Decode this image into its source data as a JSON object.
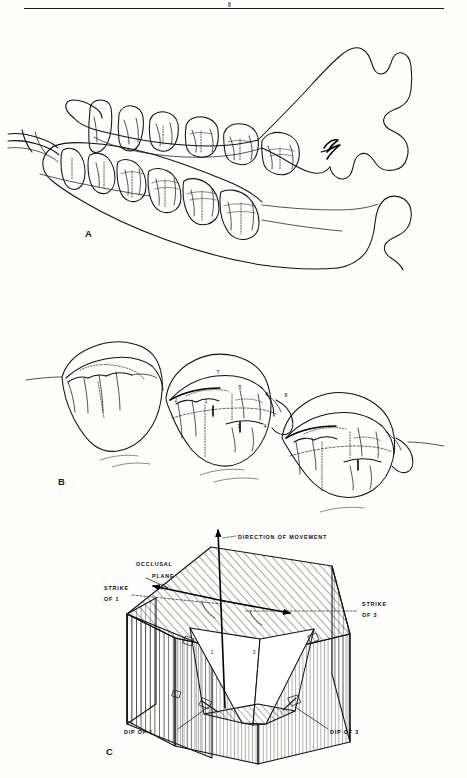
{
  "figure": {
    "panels": [
      {
        "id": "A",
        "letter": "A",
        "caption_text": "",
        "description": "lateral view of mandible and maxilla with cheek tooth rows"
      },
      {
        "id": "B",
        "letter": "B",
        "caption_text": "",
        "description": "oblique view of three molars with numbered cusps",
        "cusp_labels": [
          {
            "n": "2",
            "x": 176,
            "y": 402
          },
          {
            "n": "1",
            "x": 206,
            "y": 403
          },
          {
            "n": "7",
            "x": 218,
            "y": 374
          },
          {
            "n": "5",
            "x": 240,
            "y": 389
          },
          {
            "n": "6",
            "x": 267,
            "y": 396
          },
          {
            "n": "8",
            "x": 286,
            "y": 397
          },
          {
            "n": "3",
            "x": 239,
            "y": 428
          },
          {
            "n": "4",
            "x": 265,
            "y": 428
          }
        ]
      },
      {
        "id": "C",
        "letter": "C",
        "caption_text": "",
        "description": "block diagram of two occlusal facets showing strike and dip relative to direction of movement",
        "labels": {
          "direction_of_movement": "DIRECTION OF MOVEMENT",
          "occlusal_plane_line1": "OCCLUSAL",
          "occlusal_plane_line2": "PLANE",
          "strike_of_1_line1": "STRIKE",
          "strike_of_1_line2": "OF 1",
          "strike_of_3_line1": "STRIKE",
          "strike_of_3_line2": "OF 3",
          "dip_of_1": "DIP OF 1",
          "dip_of_3": "DIP OF 3",
          "facet_1": "1",
          "facet_3": "3"
        }
      }
    ]
  },
  "style": {
    "ink": "#111111",
    "paper": "#fdfdfc",
    "rule": "#1a1a1a"
  }
}
